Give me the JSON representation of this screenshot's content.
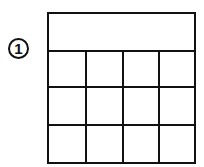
{
  "diagram": {
    "marker": {
      "label": "1",
      "shape": "circle"
    },
    "table": {
      "header_row": {
        "merged": true,
        "text": ""
      },
      "rows": 3,
      "columns": 4,
      "cells": [
        [
          "",
          "",
          "",
          ""
        ],
        [
          "",
          "",
          "",
          ""
        ],
        [
          "",
          "",
          "",
          ""
        ]
      ]
    },
    "colors": {
      "line": "#111111",
      "background": "#ffffff"
    }
  }
}
